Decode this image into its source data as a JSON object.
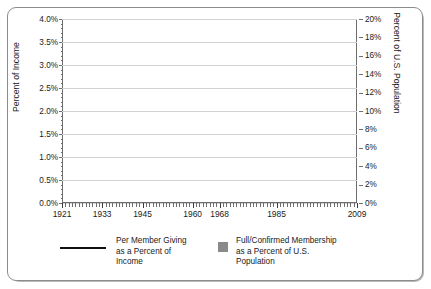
{
  "chart_data": {
    "type": "line",
    "title": "",
    "xlabel": "",
    "ylabel": "Percent of Income",
    "ylabel_secondary": "Percent of U.S. Population",
    "xlim": [
      1921,
      2009
    ],
    "ylim": [
      0.0,
      4.0
    ],
    "ylim_secondary": [
      0,
      20
    ],
    "grid": true,
    "legend_position": "bottom",
    "xticks": [
      1921,
      1933,
      1945,
      1960,
      1968,
      1985,
      2009
    ],
    "xtick_labels": [
      "1921",
      "1933",
      "1945",
      "1960",
      "1968",
      "1985",
      "2009"
    ],
    "yticks": [
      0.0,
      0.5,
      1.0,
      1.5,
      2.0,
      2.5,
      3.0,
      3.5,
      4.0
    ],
    "ytick_labels": [
      "0.0%",
      "0.5%",
      "1.0%",
      "1.5%",
      "2.0%",
      "2.5%",
      "3.0%",
      "3.5%",
      "4.0%"
    ],
    "yticks_secondary": [
      0,
      2,
      4,
      6,
      8,
      10,
      12,
      14,
      16,
      18,
      20
    ],
    "ytick_labels_secondary": [
      "0%",
      "2%",
      "4%",
      "6%",
      "8%",
      "10%",
      "12%",
      "14%",
      "16%",
      "18%",
      "20%"
    ],
    "series": [
      {
        "name": "Per Member Giving as a Percent of Income",
        "axis": "left",
        "style": "line",
        "color": "#111111",
        "x": [
          1921,
          1922,
          1923,
          1924,
          1925,
          1926,
          1927,
          1928,
          1929,
          1930,
          1931,
          1932,
          1933,
          1934,
          1935,
          1936,
          1937,
          1938,
          1939,
          1940,
          1941,
          1942,
          1943,
          1944,
          1945,
          1946,
          1947,
          1948,
          1949,
          1950,
          1951,
          1952,
          1953,
          1954,
          1955,
          1956,
          1957,
          1958,
          1959,
          1960,
          1961,
          1962,
          1963,
          1964,
          1965,
          1966,
          1967,
          1968,
          1969,
          1970,
          1971,
          1972,
          1973,
          1974,
          1975,
          1976,
          1977,
          1978,
          1979,
          1980,
          1981,
          1982,
          1983,
          1984,
          1985,
          1986,
          1987,
          1988,
          1989,
          1990,
          1991,
          1992,
          1993,
          1994,
          1995,
          1996,
          1997,
          1998,
          1999,
          2000,
          2001,
          2002,
          2003,
          2004,
          2005,
          2006,
          2007,
          2008,
          2009
        ],
        "y": [
          2.93,
          3.3,
          3.56,
          3.65,
          3.33,
          3.2,
          3.45,
          3.32,
          3.18,
          3.24,
          3.32,
          3.44,
          3.58,
          3.25,
          2.93,
          2.62,
          2.44,
          2.42,
          2.47,
          2.66,
          2.42,
          2.2,
          2.02,
          1.72,
          1.61,
          1.63,
          1.75,
          1.91,
          2.05,
          2.11,
          2.23,
          2.36,
          2.41,
          2.38,
          2.45,
          2.54,
          2.63,
          2.78,
          2.92,
          3.05,
          3.11,
          3.09,
          3.05,
          2.97,
          2.92,
          2.86,
          2.8,
          2.74,
          2.67,
          2.6,
          2.53,
          2.47,
          2.43,
          2.39,
          2.36,
          2.33,
          2.33,
          2.32,
          2.34,
          2.36,
          2.37,
          2.35,
          2.33,
          2.36,
          2.38,
          2.39,
          2.38,
          2.37,
          2.36,
          2.35,
          2.33,
          2.34,
          2.36,
          2.34,
          2.36,
          2.38,
          2.4,
          2.43,
          2.45,
          2.47,
          2.49,
          2.46,
          2.42,
          2.39,
          2.38,
          2.4,
          2.42,
          2.38,
          2.34
        ]
      },
      {
        "name": "Full/Confirmed Membership as a Percent of U.S. Population",
        "axis": "right",
        "style": "thick-band",
        "color": "#8a8a8a",
        "x": [
          1921,
          1922,
          1923,
          1924,
          1925,
          1926,
          1927,
          1928,
          1929,
          1930,
          1931,
          1932,
          1933,
          1934,
          1935,
          1936,
          1937,
          1938,
          1939,
          1940,
          1941,
          1942,
          1943,
          1944,
          1945,
          1946,
          1947,
          1948,
          1949,
          1950,
          1951,
          1952,
          1953,
          1954,
          1955,
          1956,
          1957,
          1958,
          1959,
          1960,
          1961,
          1962,
          1963,
          1964,
          1965,
          1966,
          1967,
          1968,
          1969,
          1970,
          1971,
          1972,
          1973,
          1974,
          1975,
          1976,
          1977,
          1978,
          1979,
          1980,
          1981,
          1982,
          1983,
          1984,
          1985,
          1986,
          1987,
          1988,
          1989,
          1990,
          1991,
          1992,
          1993,
          1994,
          1995,
          1996,
          1997,
          1998,
          1999,
          2000,
          2001,
          2002,
          2003,
          2004,
          2005,
          2006,
          2007,
          2008,
          2009
        ],
        "y": [
          16.0,
          16.2,
          16.4,
          16.6,
          16.8,
          16.9,
          17.0,
          17.1,
          17.1,
          17.2,
          17.3,
          17.3,
          17.2,
          17.1,
          17.1,
          17.0,
          17.1,
          17.2,
          17.3,
          17.4,
          17.5,
          17.6,
          17.7,
          17.8,
          17.9,
          18.1,
          18.2,
          18.4,
          18.5,
          18.6,
          18.8,
          18.9,
          19.0,
          19.2,
          19.3,
          19.5,
          19.6,
          19.8,
          19.9,
          19.8,
          19.7,
          20.0,
          19.9,
          19.7,
          19.5,
          19.3,
          19.0,
          18.8,
          18.5,
          18.2,
          17.9,
          17.6,
          17.3,
          17.0,
          16.7,
          16.4,
          16.1,
          15.8,
          15.5,
          15.2,
          14.9,
          14.6,
          14.3,
          14.0,
          13.7,
          13.5,
          13.2,
          13.0,
          12.8,
          12.6,
          12.4,
          12.3,
          12.1,
          12.0,
          11.9,
          11.8,
          11.8,
          11.8,
          11.8,
          11.9,
          11.9,
          11.9,
          11.8,
          11.7,
          11.6,
          11.5,
          11.4,
          11.2,
          11.0
        ],
        "outlier_marker": {
          "x": 1926,
          "y": 14.3,
          "note": "single dropped marker connected by thin lines"
        }
      }
    ]
  },
  "legend": {
    "entries": [
      {
        "label_lines": [
          "Per Member Giving",
          "as a Percent of",
          "Income"
        ],
        "marker": "line",
        "color": "#111111"
      },
      {
        "label_lines": [
          "Full/Confirmed Membership",
          "as a Percent of U.S.",
          "Population"
        ],
        "marker": "square",
        "color": "#8a8a8a"
      }
    ]
  },
  "colors": {
    "line_series": "#111111",
    "band_series": "#8a8a8a",
    "gridline": "#d2d2d2",
    "axis": "#6e6e6e",
    "frame_border": "#8c8c8c",
    "background": "#ffffff"
  }
}
